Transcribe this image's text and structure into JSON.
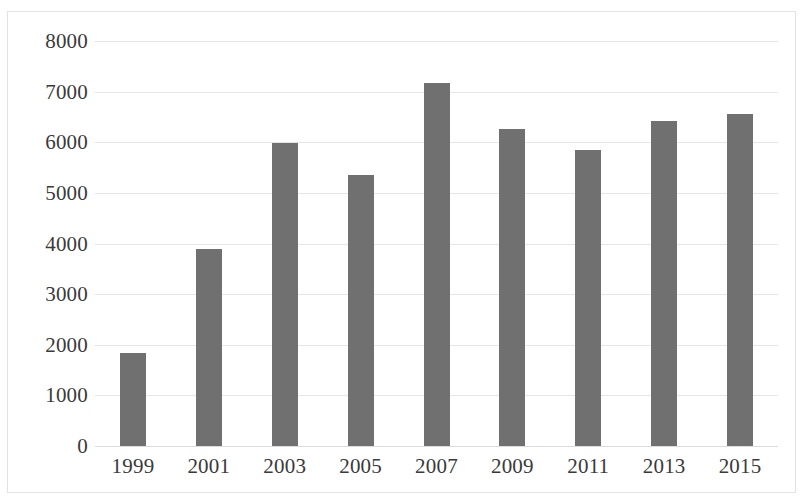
{
  "chart_data": {
    "type": "bar",
    "title": "",
    "subtitle": "",
    "xlabel": "",
    "ylabel": "",
    "categories": [
      "1999",
      "2001",
      "2003",
      "2005",
      "2007",
      "2009",
      "2011",
      "2013",
      "2015"
    ],
    "values": [
      1830,
      3890,
      5980,
      5350,
      7170,
      6270,
      5850,
      6420,
      6550
    ],
    "series": [
      {
        "name": "",
        "values": [
          1830,
          3890,
          5980,
          5350,
          7170,
          6270,
          5850,
          6420,
          6550
        ]
      }
    ],
    "ylim": [
      0,
      8000
    ],
    "ytick_labels": [
      "8000",
      "7000",
      "6000",
      "5000",
      "4000",
      "3000",
      "2000",
      "1000",
      "0"
    ],
    "ytick_values": [
      8000,
      7000,
      6000,
      5000,
      4000,
      3000,
      2000,
      1000,
      0
    ],
    "ytick_step": 1000,
    "grid": true,
    "grid_axis": "y",
    "legend": false,
    "legend_position": "none",
    "bar_color": "#707070",
    "grid_color": "#e6e6e6",
    "border_color": "#e2e2e2",
    "text_color": "#3a3a3a",
    "background_color": "#ffffff",
    "annotations": []
  }
}
